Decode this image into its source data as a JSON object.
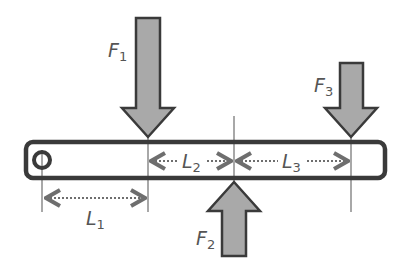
{
  "diagram": {
    "type": "lever-beam-force-diagram",
    "colors": {
      "beam_stroke": "#3a3a3a",
      "arrow_fill": "#a9a9a9",
      "arrow_stroke": "#3a3a3a",
      "guide_line": "#6e6e6e",
      "dimension_line": "#6e6e6e",
      "label": "#555555"
    },
    "forces": [
      {
        "id": "F1",
        "letter": "F",
        "subscript": "1",
        "direction": "down"
      },
      {
        "id": "F2",
        "letter": "F",
        "subscript": "2",
        "direction": "up"
      },
      {
        "id": "F3",
        "letter": "F",
        "subscript": "3",
        "direction": "down"
      }
    ],
    "lengths": [
      {
        "id": "L1",
        "letter": "L",
        "subscript": "1"
      },
      {
        "id": "L2",
        "letter": "L",
        "subscript": "2"
      },
      {
        "id": "L3",
        "letter": "L",
        "subscript": "3"
      }
    ],
    "pivot": {
      "shape": "circle"
    }
  }
}
